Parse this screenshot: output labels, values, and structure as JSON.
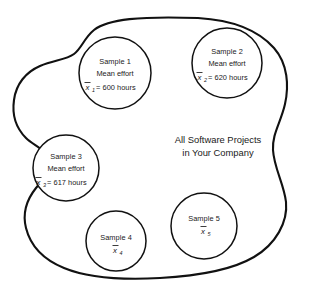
{
  "diagram": {
    "population": {
      "label_line1": "All Software Projects",
      "label_line2": "in Your Company",
      "shape": "irregular-blob",
      "fill_color": "#ffffff",
      "stroke_color": "#111111"
    },
    "samples": [
      {
        "id": "sample-1",
        "name": "Sample 1",
        "mean_label": "Mean effort",
        "symbol": "x",
        "subscript": "1",
        "equals": "=",
        "value": "600",
        "unit": "hours",
        "value_line": "= 600 hours",
        "cx": 115,
        "cy": 73,
        "r": 36
      },
      {
        "id": "sample-2",
        "name": "Sample 2",
        "mean_label": "Mean effort",
        "symbol": "x",
        "subscript": "2",
        "equals": "=",
        "value": "620",
        "unit": "hours",
        "value_line": "= 620 hours",
        "cx": 227,
        "cy": 63,
        "r": 35
      },
      {
        "id": "sample-3",
        "name": "Sample 3",
        "mean_label": "Mean effort",
        "symbol": "x",
        "subscript": "3",
        "equals": "=",
        "value": "617",
        "unit": "hours",
        "value_line": "= 617 hours",
        "cx": 66,
        "cy": 168,
        "r": 33
      },
      {
        "id": "sample-4",
        "name": "Sample 4",
        "mean_label": "",
        "symbol": "x",
        "subscript": "4",
        "equals": "",
        "value": "",
        "unit": "",
        "value_line": "",
        "cx": 116,
        "cy": 241,
        "r": 30
      },
      {
        "id": "sample-5",
        "name": "Sample 5",
        "mean_label": "",
        "symbol": "x",
        "subscript": "5",
        "equals": "",
        "value": "",
        "unit": "",
        "value_line": "",
        "cx": 204,
        "cy": 226,
        "r": 33
      }
    ]
  }
}
